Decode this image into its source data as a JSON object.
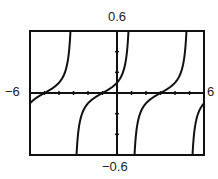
{
  "chart_data": {
    "type": "line",
    "title": "",
    "xlabel": "",
    "ylabel": "",
    "function": "y = 0.1 * tan(pi * (x + 1) / 4)",
    "xlim": [
      -6,
      6
    ],
    "ylim": [
      -0.6,
      0.6
    ],
    "x_tick_step": 1,
    "y_tick_step": 0.2,
    "grid": false,
    "legend": null,
    "window_labels": {
      "xmin": "−6",
      "xmax": "6",
      "ymin": "−0.6",
      "ymax": "0.6"
    },
    "series": [
      {
        "name": "tangent curve",
        "amplitude": 0.1,
        "period": 4,
        "phase_shift": -1,
        "vertical_asymptotes": [
          -3,
          1,
          5
        ],
        "zeros": [
          -5,
          -1,
          3
        ],
        "color": "#111111"
      }
    ]
  }
}
